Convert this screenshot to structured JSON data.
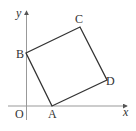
{
  "diagram": {
    "type": "coordinate-geometry",
    "axes": {
      "x_label": "x",
      "y_label": "y",
      "origin_label": "O"
    },
    "vertices": [
      {
        "label": "A",
        "px": [
          52,
          106
        ]
      },
      {
        "label": "B",
        "px": [
          26,
          53
        ]
      },
      {
        "label": "C",
        "px": [
          80,
          27
        ]
      },
      {
        "label": "D",
        "px": [
          107,
          80
        ]
      }
    ],
    "colors": {
      "axis": "#999999",
      "square": "#333333",
      "text": "#333333"
    }
  }
}
